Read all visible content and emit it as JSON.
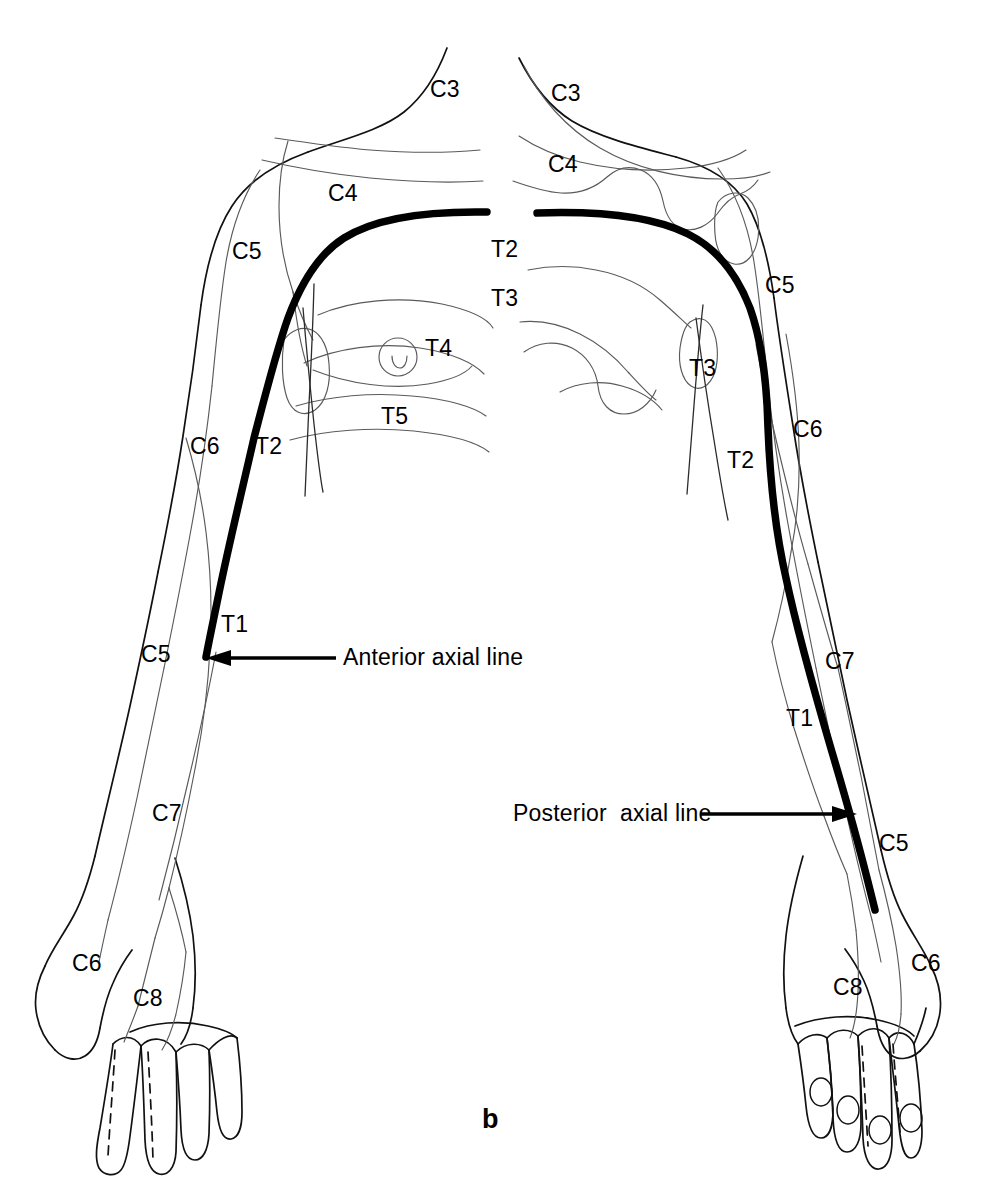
{
  "figure": {
    "panel_letter": "b",
    "caption_title": "Dermatomes of the upper limb and thorax",
    "view_left": "anterior",
    "view_right": "posterior",
    "colors": {
      "outline": "#111111",
      "dermatome_line": "#5a5a5a",
      "axial_line": "#000000",
      "background": "#ffffff",
      "text": "#000000"
    }
  },
  "annotations": [
    {
      "id": "anterior-axial-line",
      "text": "Anterior axial line",
      "x": 343,
      "y": 646,
      "arrow_from_x": 336,
      "arrow_from_y": 658,
      "arrow_to_x": 207,
      "arrow_to_y": 658
    },
    {
      "id": "posterior-axial-line",
      "text": "Posterior  axial line",
      "x": 513,
      "y": 802,
      "arrow_from_x": 700,
      "arrow_from_y": 814,
      "arrow_to_x": 855,
      "arrow_to_y": 814
    }
  ],
  "labels": {
    "left_panel": [
      {
        "id": "left-c3-neck",
        "text": "C3",
        "x": 430,
        "y": 78
      },
      {
        "id": "left-c4-chest",
        "text": "C4",
        "x": 328,
        "y": 182
      },
      {
        "id": "left-c5-shoulder",
        "text": "C5",
        "x": 232,
        "y": 240
      },
      {
        "id": "left-c6-arm",
        "text": "C6",
        "x": 190,
        "y": 435
      },
      {
        "id": "left-t2-arm",
        "text": "T2",
        "x": 255,
        "y": 435
      },
      {
        "id": "left-t1-arm",
        "text": "T1",
        "x": 221,
        "y": 613
      },
      {
        "id": "left-c5-forearm",
        "text": "C5",
        "x": 141,
        "y": 643
      },
      {
        "id": "left-c7-forearm",
        "text": "C7",
        "x": 152,
        "y": 802
      },
      {
        "id": "left-c6-hand",
        "text": "C6",
        "x": 72,
        "y": 952
      },
      {
        "id": "left-c8-hand",
        "text": "C8",
        "x": 133,
        "y": 987
      }
    ],
    "midline": [
      {
        "id": "mid-t2",
        "text": "T2",
        "x": 491,
        "y": 238
      },
      {
        "id": "mid-t3",
        "text": "T3",
        "x": 491,
        "y": 287
      },
      {
        "id": "mid-t4",
        "text": "T4",
        "x": 425,
        "y": 337
      },
      {
        "id": "mid-t5",
        "text": "T5",
        "x": 381,
        "y": 405
      }
    ],
    "right_panel": [
      {
        "id": "right-c3-neck",
        "text": "C3",
        "x": 551,
        "y": 82
      },
      {
        "id": "right-c4-back",
        "text": "C4",
        "x": 548,
        "y": 153
      },
      {
        "id": "right-c5-shoulder",
        "text": "C5",
        "x": 765,
        "y": 274
      },
      {
        "id": "right-t3-axilla",
        "text": "T3",
        "x": 689,
        "y": 357
      },
      {
        "id": "right-t2-arm",
        "text": "T2",
        "x": 727,
        "y": 449
      },
      {
        "id": "right-c6-arm",
        "text": "C6",
        "x": 793,
        "y": 418
      },
      {
        "id": "right-c7-elbow",
        "text": "C7",
        "x": 825,
        "y": 650
      },
      {
        "id": "right-t1-forearm",
        "text": "T1",
        "x": 786,
        "y": 707
      },
      {
        "id": "right-c5-forearm",
        "text": "C5",
        "x": 879,
        "y": 832
      },
      {
        "id": "right-c8-hand",
        "text": "C8",
        "x": 833,
        "y": 976
      },
      {
        "id": "right-c6-hand",
        "text": "C6",
        "x": 911,
        "y": 952
      }
    ]
  },
  "dermatome_codes": [
    "C3",
    "C4",
    "C5",
    "C6",
    "C7",
    "C8",
    "T1",
    "T2",
    "T3",
    "T4",
    "T5"
  ],
  "panel_letter_pos": {
    "x": 482,
    "y": 1106
  }
}
